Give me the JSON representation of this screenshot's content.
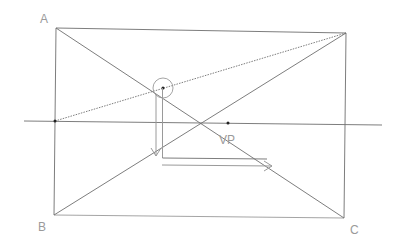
{
  "labels": {
    "A": "A",
    "B": "B",
    "C": "C",
    "VP": "VP"
  },
  "colors": {
    "line": "#6e6e6e",
    "light_line": "#9a9a9a",
    "label": "#9a9a9a",
    "background": "#ffffff"
  },
  "geometry": {
    "corner_A": [
      56,
      28
    ],
    "corner_top_right": [
      346,
      33
    ],
    "corner_B": [
      54,
      215
    ],
    "corner_C": [
      344,
      218
    ],
    "vanishing_point": [
      228,
      123
    ],
    "circle_center": [
      163,
      88
    ],
    "circle_radius": 10,
    "horizon": [
      [
        24,
        121
      ],
      [
        382,
        125
      ]
    ]
  }
}
